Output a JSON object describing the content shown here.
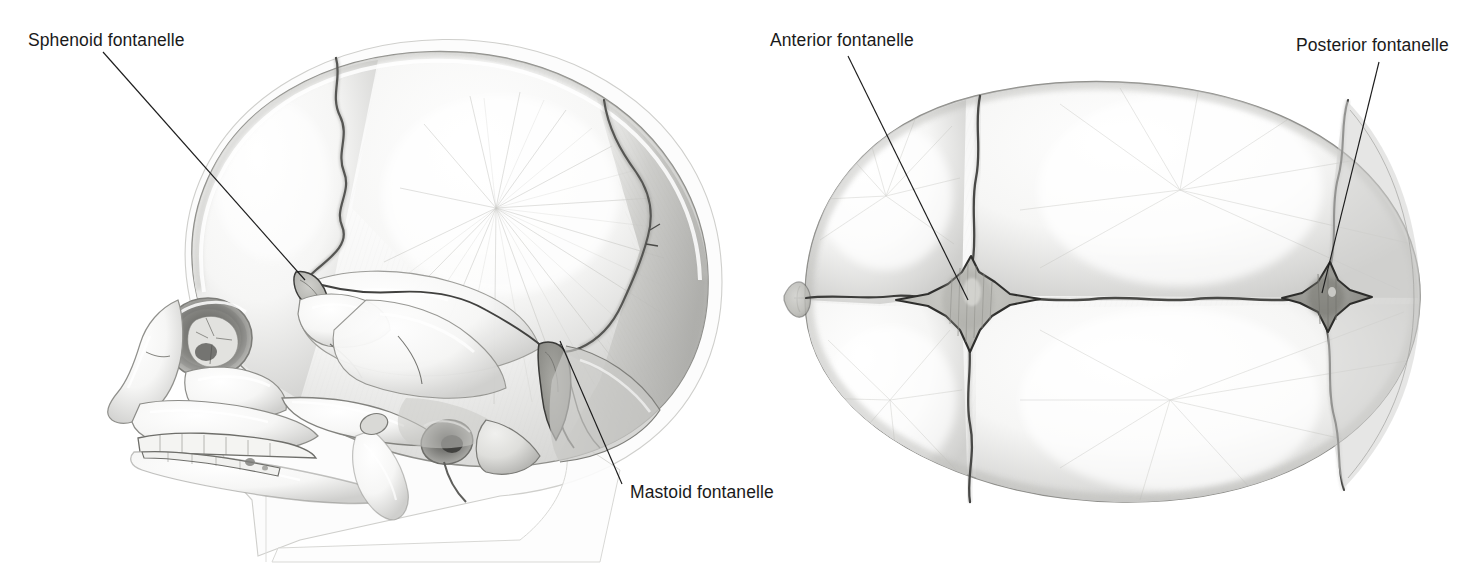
{
  "figure": {
    "type": "anatomical-illustration",
    "background_color": "#ffffff",
    "ink_color": "#1a1a1a",
    "views": [
      {
        "id": "lateral",
        "name": "lateral-view-skull",
        "description": "Left lateral view of a newborn skull showing frontal, parietal, occipital, temporal bones, orbit, maxilla, teeth and mandible"
      },
      {
        "id": "superior",
        "name": "superior-view-skull",
        "description": "Superior (vertex) view of a newborn skull showing frontal bones, paired parietal bones, occipital bone, sagittal, coronal, metopic and lambdoid sutures"
      }
    ]
  },
  "labels": [
    {
      "id": "sphenoid",
      "name": "label-sphenoid-fontanelle",
      "text": "Sphenoid fontanelle",
      "text_x": 28,
      "text_y": 46,
      "anchor": "start",
      "leader": {
        "x1": 103,
        "y1": 52,
        "x2": 305,
        "y2": 280
      }
    },
    {
      "id": "mastoid",
      "name": "label-mastoid-fontanelle",
      "text": "Mastoid fontanelle",
      "text_x": 630,
      "text_y": 498,
      "anchor": "start",
      "leader": {
        "x1": 622,
        "y1": 484,
        "x2": 560,
        "y2": 341
      }
    },
    {
      "id": "anterior",
      "name": "label-anterior-fontanelle",
      "text": "Anterior fontanelle",
      "text_x": 770,
      "text_y": 46,
      "anchor": "start",
      "leader": {
        "x1": 848,
        "y1": 56,
        "x2": 968,
        "y2": 300
      }
    },
    {
      "id": "posterior",
      "name": "label-posterior-fontanelle",
      "text": "Posterior fontanelle",
      "text_x": 1296,
      "text_y": 51,
      "anchor": "start",
      "leader": {
        "x1": 1379,
        "y1": 62,
        "x2": 1322,
        "y2": 293
      }
    }
  ],
  "fontanelles": [
    {
      "id": "sphenoid",
      "view": "lateral",
      "cx": 305,
      "cy": 281,
      "shape": "irregular-slit"
    },
    {
      "id": "mastoid",
      "view": "lateral",
      "cx": 557,
      "cy": 352,
      "shape": "irregular-wedge"
    },
    {
      "id": "anterior",
      "view": "superior",
      "cx": 967,
      "cy": 300,
      "shape": "diamond-star"
    },
    {
      "id": "posterior",
      "view": "superior",
      "cx": 1325,
      "cy": 296,
      "shape": "triangular-star"
    }
  ]
}
